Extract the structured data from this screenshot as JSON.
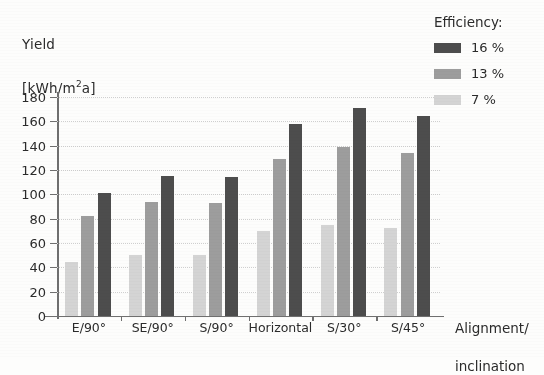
{
  "chart_data": {
    "type": "bar",
    "title": "",
    "ylabel": "Yield\n[kWh/m²a]",
    "ylabel_line1": "Yield",
    "ylabel_line2_pre": "[kWh/m",
    "ylabel_line2_sup": "2",
    "ylabel_line2_post": "a]",
    "xlabel": "Alignment/\ninclination",
    "xlabel_line1": "Alignment/",
    "xlabel_line2": "inclination",
    "categories": [
      "E/90°",
      "SE/90°",
      "S/90°",
      "Horizontal",
      "S/30°",
      "S/45°"
    ],
    "series": [
      {
        "name": "16 %",
        "color": "#4d4d4d",
        "values": [
          101,
          115,
          114,
          158,
          171,
          164
        ]
      },
      {
        "name": "13 %",
        "color": "#9d9d9d",
        "values": [
          82,
          94,
          93,
          129,
          139,
          134
        ]
      },
      {
        "name": "7 %",
        "color": "#d4d4d4",
        "values": [
          44,
          50,
          50,
          70,
          75,
          72
        ]
      }
    ],
    "series_draw_order": [
      "7 %",
      "13 %",
      "16 %"
    ],
    "ylim": [
      0,
      180
    ],
    "yticks": [
      0,
      20,
      40,
      60,
      80,
      100,
      120,
      140,
      160,
      180
    ],
    "ytick_labels": [
      "0",
      "20",
      "40",
      "60",
      "80",
      "100",
      "120",
      "140",
      "160",
      "180"
    ],
    "grid": true,
    "grid_axis": "y",
    "legend_position": "top-right"
  },
  "legend": {
    "title": "Efficiency:",
    "entries": [
      {
        "label": "16 %",
        "swatch": "s16"
      },
      {
        "label": "13 %",
        "swatch": "s13"
      },
      {
        "label": "7 %",
        "swatch": "s7"
      }
    ]
  },
  "colors": {
    "series_16": "#4d4d4d",
    "series_13": "#9d9d9d",
    "series_7": "#d4d4d4",
    "axis": "#6f6f6f",
    "grid": "#cfcfcf",
    "background": "#fdfdfc",
    "text": "#2b2b2b"
  }
}
